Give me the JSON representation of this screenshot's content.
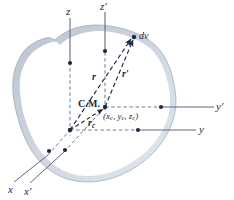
{
  "figure": {
    "caption_type": "rigid-body-center-of-mass-diagram",
    "background_color": "#ffffff",
    "ink_color": "#1b2a44",
    "body": {
      "name": "rigid-body-blob",
      "fill_color": "#ffffff",
      "band_color": "#c3ccd8",
      "band_color_light": "#dfe5ec",
      "outline_color": "#8d9aab"
    }
  },
  "axes": [
    {
      "id": "z",
      "label": "z",
      "prime": false,
      "kind": "vertical",
      "dashed_upper": false
    },
    {
      "id": "zprime",
      "label": "z",
      "prime": true,
      "kind": "vertical",
      "dashed_upper": false
    },
    {
      "id": "y",
      "label": "y",
      "prime": false,
      "kind": "horizontal",
      "dashed_upper": false
    },
    {
      "id": "yprime",
      "label": "y",
      "prime": true,
      "kind": "horizontal",
      "dashed_upper": false
    },
    {
      "id": "x",
      "label": "x",
      "prime": false,
      "kind": "oblique",
      "dashed_upper": false
    },
    {
      "id": "xprime",
      "label": "x",
      "prime": true,
      "kind": "oblique",
      "dashed_upper": false
    }
  ],
  "axis_labels": {
    "z": "z",
    "z_prime": "z′",
    "y": "y",
    "y_prime": "y′",
    "x": "x",
    "x_prime": "x′"
  },
  "vectors": [
    {
      "id": "r",
      "label": "r",
      "prime": false,
      "subscript": "",
      "from": "origin",
      "to": "dv-point",
      "style": "dashed-arrow"
    },
    {
      "id": "rprime",
      "label": "r",
      "prime": true,
      "subscript": "",
      "from": "center-of-mass",
      "to": "dv-point",
      "style": "dashed-arrow"
    },
    {
      "id": "rc",
      "label": "r",
      "prime": false,
      "subscript": "c",
      "from": "origin",
      "to": "center-of-mass",
      "style": "dashed-arrow"
    }
  ],
  "vector_labels": {
    "r": "r",
    "r_prime": "r′",
    "r_c_base": "r",
    "r_c_sub": "c"
  },
  "points": {
    "center_of_mass": {
      "label": "C.M.",
      "coordinates_text": "(x",
      "coord_sub_1": "c",
      "coord_mid_1": ", y",
      "coord_sub_2": "c",
      "coord_mid_2": ", z",
      "coord_sub_3": "c",
      "coord_close": ")"
    },
    "volume_element": {
      "label": "dv",
      "description": "differential volume element"
    },
    "origin": {
      "label": "",
      "description": "common origin of unprimed axes"
    }
  },
  "marker_dots": [
    {
      "id": "dot-z-axis",
      "name": "z-axis-surface-dot"
    },
    {
      "id": "dot-zprime-axis",
      "name": "zprime-axis-surface-dot"
    },
    {
      "id": "dot-y-axis",
      "name": "y-axis-surface-dot"
    },
    {
      "id": "dot-yprime-axis",
      "name": "yprime-axis-surface-dot"
    },
    {
      "id": "dot-x-axis",
      "name": "x-axis-surface-dot"
    },
    {
      "id": "dot-xprime-axis",
      "name": "xprime-axis-surface-dot"
    },
    {
      "id": "dot-origin",
      "name": "origin-dot"
    },
    {
      "id": "dot-cm",
      "name": "center-of-mass-dot"
    },
    {
      "id": "dot-dv",
      "name": "volume-element-dot"
    }
  ]
}
